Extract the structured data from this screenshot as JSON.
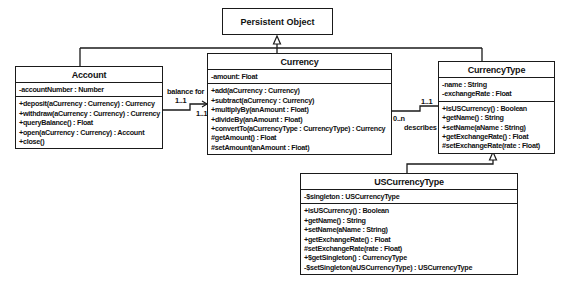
{
  "diagram": {
    "type": "UML class diagram",
    "classes": {
      "persistent_object": {
        "name": "Persistent Object"
      },
      "account": {
        "name": "Account",
        "attributes": [
          "-accountNumber : Number"
        ],
        "operations": [
          "+deposit(aCurrency : Currency) : Currency",
          "+withdraw(aCurrency : Currency) : Currency",
          "+queryBalance() : Float",
          "+open(aCurrency : Currency) : Account",
          "+close()"
        ]
      },
      "currency": {
        "name": "Currency",
        "attributes": [
          "-amount: Float"
        ],
        "operations": [
          "+add(aCurrency : Currency)",
          "+subtract(aCurrency : Currency)",
          "+multiplyBy(anAmount : Float)",
          "+divideBy(anAmount : Float)",
          "+convertTo(aCurrencyType : CurrencyType) : Currency",
          "#getAmount() : Float",
          "#setAmount(anAmount : Float)"
        ]
      },
      "currency_type": {
        "name": "CurrencyType",
        "attributes": [
          "-name : String",
          "-exchangeRate : Float"
        ],
        "operations": [
          "+isUSCurrency() : Boolean",
          "+getName() : String",
          "+setName(aName : String)",
          "+getExchangeRate() : Float",
          "#setExchangeRate(rate : Float)"
        ]
      },
      "us_currency_type": {
        "name": "USCurrencyType",
        "attributes": [
          "-$singleton : USCurrencyType"
        ],
        "operations": [
          "+isUSCurrency() : Boolean",
          "+getName() : String",
          "+setName(aName : String)",
          "+getExchangeRate() : Float",
          "#setExchangeRate(rate : Float)",
          "+$getSingleton() : CurrencyType",
          "-$setSingleton(aUSCurrencyType) : USCurrencyType"
        ]
      }
    },
    "associations": {
      "balance_for": {
        "label": "balance for",
        "source_mult": "1..1",
        "target_mult": "1..1"
      },
      "describes": {
        "label": "describes",
        "source_mult": "0..n",
        "target_mult": "1..1"
      }
    }
  }
}
